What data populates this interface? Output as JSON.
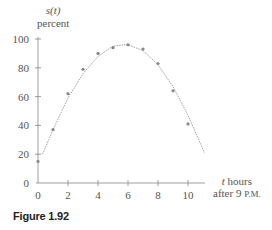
{
  "chart_data": {
    "type": "scatter",
    "title": "",
    "caption": "Figure 1.92",
    "ylabel_line1": "s(t)",
    "ylabel_line2": "percent",
    "xlabel_line1": "t hours",
    "xlabel_line2": "after 9 P.M.",
    "x_ticks": [
      0,
      2,
      4,
      6,
      8,
      10
    ],
    "y_ticks": [
      0,
      20,
      40,
      60,
      80,
      100
    ],
    "xlim": [
      0,
      11
    ],
    "ylim": [
      0,
      100
    ],
    "grid": false,
    "series": [
      {
        "name": "data points",
        "type": "scatter",
        "x": [
          0,
          1,
          2,
          3,
          4,
          5,
          6,
          7,
          8,
          9,
          10
        ],
        "y": [
          15,
          37,
          62,
          79,
          90,
          94,
          96,
          93,
          83,
          64,
          41
        ]
      },
      {
        "name": "fitted curve",
        "type": "line",
        "style": "dotted",
        "x": [
          0.3,
          1,
          2,
          3,
          4,
          5,
          5.7,
          6,
          7,
          8,
          9,
          10,
          11.1
        ],
        "y": [
          20,
          37,
          59,
          76,
          88,
          95,
          96,
          96,
          92,
          82,
          67,
          47,
          21
        ]
      }
    ]
  },
  "labels": {
    "y_var": "s(t)",
    "y_unit": "percent",
    "x_var": "t",
    "x_unit": " hours",
    "x_line2_pre": "after 9 ",
    "x_line2_sc": "P.M.",
    "caption": "Figure 1.92"
  }
}
